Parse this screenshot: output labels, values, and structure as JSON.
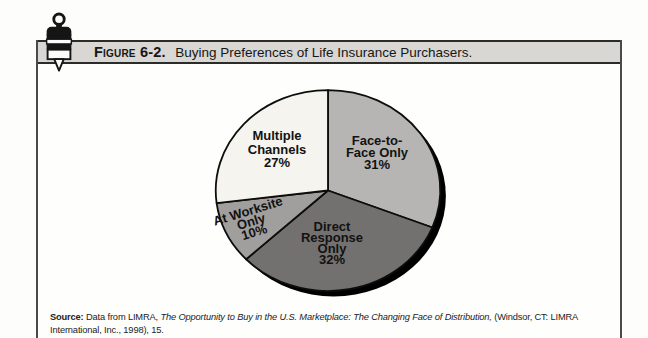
{
  "figure": {
    "label": "Figure 6-2.",
    "title": "Buying Preferences of Life Insurance Purchasers."
  },
  "chart_data": {
    "type": "pie",
    "title": "Buying Preferences of Life Insurance Purchasers",
    "start_angle": "top, clockwise",
    "outline_color": "#0d0d0d",
    "shadow_color": "#000000",
    "slices": [
      {
        "label": "Face-to-Face Only",
        "value": 31,
        "color": "#b6b5b3",
        "label_lines": [
          "Face-to-",
          "Face Only",
          "31%"
        ]
      },
      {
        "label": "Direct Response Only",
        "value": 32,
        "color": "#727170",
        "label_lines": [
          "Direct",
          "Response",
          "Only",
          "32%"
        ]
      },
      {
        "label": "At Worksite Only",
        "value": 10,
        "color": "#a09f9d",
        "label_lines": [
          "At Worksite",
          "Only",
          "10%"
        ]
      },
      {
        "label": "Multiple Channels",
        "value": 27,
        "color": "#f5f4ef",
        "label_lines": [
          "Multiple",
          "Channels",
          "27%"
        ]
      }
    ]
  },
  "source": {
    "prefix": "Source:",
    "pre_title": " Data from LIMRA, ",
    "title_italic": "The Opportunity to Buy in the U.S. Marketplace: The Changing Face of Distribution,",
    "suffix": " (Windsor, CT: LIMRA International, Inc., 1998), 15."
  },
  "colors": {
    "header_band": "#d8d7d3",
    "box_border": "#4a4a48",
    "band_border": "#2b2b29"
  }
}
